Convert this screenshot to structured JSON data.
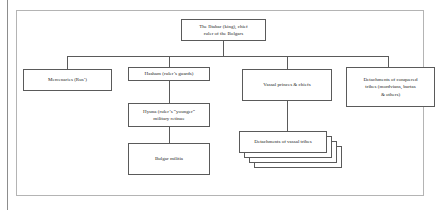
{
  "diagram": {
    "type": "organizational-hierarchy",
    "root": {
      "id": "iltabar",
      "label": "The Iltabar (king), chief\nruler of the Bolgars"
    },
    "level_two": [
      {
        "id": "mercenaries",
        "label": "Mercenaries (Rus’)"
      },
      {
        "id": "hasham",
        "label": "Hasham (ruler’s guards)"
      },
      {
        "id": "vassal-princes",
        "label": "Vassal princes & chiefs"
      },
      {
        "id": "conquered-tribes",
        "label": "Detachments of conquered\ntribes (mordvians, burtas\n& others)"
      }
    ],
    "level_three": [
      {
        "id": "hyuna",
        "label": "Hyuna (ruler’s “younger”\nmilitary retinue"
      },
      {
        "id": "vassal-detachments",
        "label": "Detachments of vassal tribes",
        "stacked": true,
        "stack_count": 4
      }
    ],
    "level_four": [
      {
        "id": "bulgar-militia",
        "label": "Bulgar militia"
      }
    ],
    "edges": [
      {
        "from": "iltabar",
        "to": "mercenaries"
      },
      {
        "from": "iltabar",
        "to": "hasham"
      },
      {
        "from": "iltabar",
        "to": "vassal-princes"
      },
      {
        "from": "iltabar",
        "to": "conquered-tribes"
      },
      {
        "from": "hasham",
        "to": "hyuna"
      },
      {
        "from": "hyuna",
        "to": "bulgar-militia"
      },
      {
        "from": "vassal-princes",
        "to": "vassal-detachments"
      }
    ],
    "colors": {
      "box_border": "#5a5a5a",
      "connector": "#5a5a5a",
      "frame_border": "#b4b4b4",
      "background": "#ffffff",
      "text": "#1d1d1d"
    }
  }
}
